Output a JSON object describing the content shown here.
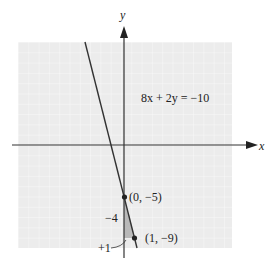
{
  "figure": {
    "equation": "8x + 2y = −10",
    "x_axis_label": "x",
    "y_axis_label": "y",
    "points": [
      {
        "label": "(0, −5)",
        "x": 0,
        "y": -5
      },
      {
        "label": "(1, −9)",
        "x": 1,
        "y": -9
      }
    ],
    "rise_label": "−4",
    "run_label": "+1",
    "colors": {
      "grid_bg": "#ececec",
      "grid_line": "#f8f8f8",
      "axis": "#333333",
      "line": "#333333",
      "slope_triangle": "#b0b0b0"
    }
  }
}
